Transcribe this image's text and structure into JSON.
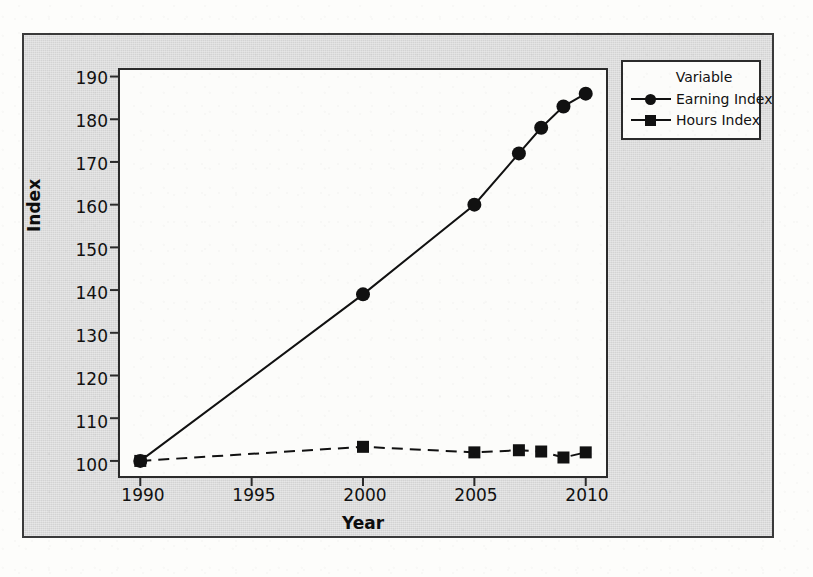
{
  "chart_data": {
    "type": "line",
    "title": "",
    "xlabel": "Year",
    "ylabel": "Index",
    "xlim": [
      1989,
      2011
    ],
    "ylim": [
      96,
      192
    ],
    "xticks": [
      1990,
      1995,
      2000,
      2005,
      2010
    ],
    "yticks": [
      100,
      110,
      120,
      130,
      140,
      150,
      160,
      170,
      180,
      190
    ],
    "grid": false,
    "legend_position": "right-outside",
    "legend_title": "Variable",
    "series": [
      {
        "name": "Earning Index",
        "marker": "circle",
        "linestyle": "solid",
        "color": "#111111",
        "x": [
          1990,
          2000,
          2005,
          2007,
          2008,
          2009,
          2010
        ],
        "values": [
          100,
          139,
          160,
          172,
          178,
          183,
          186
        ]
      },
      {
        "name": "Hours Index",
        "marker": "square",
        "linestyle": "dashed",
        "color": "#111111",
        "x": [
          1990,
          2000,
          2005,
          2007,
          2008,
          2009,
          2010
        ],
        "values": [
          100,
          103.3,
          102,
          102.5,
          102.2,
          100.8,
          102
        ]
      }
    ]
  },
  "axes": {
    "y_tick_labels": [
      "190",
      "180",
      "170",
      "160",
      "150",
      "140",
      "130",
      "120",
      "110",
      "100"
    ],
    "x_tick_labels": [
      "1990",
      "1995",
      "2000",
      "2005",
      "2010"
    ],
    "x_title": "Year",
    "y_title": "Index"
  },
  "legend": {
    "title": "Variable",
    "items": [
      {
        "label": "Earning Index",
        "marker": "circle-marker"
      },
      {
        "label": "Hours Index",
        "marker": "square-marker"
      }
    ]
  }
}
